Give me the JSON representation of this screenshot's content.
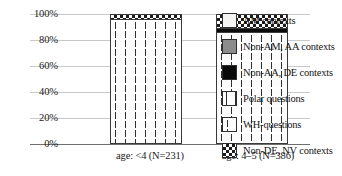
{
  "chart_data": {
    "type": "bar",
    "subtype": "stacked-percentage",
    "title": "",
    "xlabel": "",
    "ylabel": "",
    "ylim": [
      0,
      100
    ],
    "ytick_labels": [
      "100%",
      "80%",
      "60%",
      "40%",
      "20%",
      "0%"
    ],
    "ytick_values": [
      100,
      80,
      60,
      40,
      20,
      0
    ],
    "grid": true,
    "legend_position": "right",
    "categories": [
      "age: <4 (N=231)",
      "age: 4–5 (N=386)"
    ],
    "series": [
      {
        "name": "AM contexts",
        "pattern": "solid-white",
        "color": "#f4f4f2",
        "values": [
          0,
          0
        ]
      },
      {
        "name": "Non-AM, AA contexts",
        "pattern": "solid-gray",
        "color": "#8c8c8c",
        "values": [
          0,
          0
        ]
      },
      {
        "name": "Non-AA, DE contexts",
        "pattern": "solid-black",
        "color": "#0a0a0a",
        "values": [
          0,
          0
        ]
      },
      {
        "name": "Polar questions",
        "pattern": "dashes",
        "color": "#2b2b2b",
        "values": [
          0,
          0
        ]
      },
      {
        "name": "WH-questions",
        "pattern": "vertical-ticks",
        "color": "#2f2f2f",
        "values": [
          97,
          87
        ]
      },
      {
        "name": "Non-DE, NV contexts",
        "pattern": "checkerboard",
        "color": "#1c1c1c",
        "values": [
          3,
          13
        ]
      }
    ],
    "bars": [
      {
        "category": "age: <4 (N=231)",
        "segments": [
          {
            "label": "WH-questions",
            "value": 97
          },
          {
            "label": "Non-DE, NV contexts",
            "value": 3
          }
        ]
      },
      {
        "category": "age: 4–5 (N=386)",
        "segments": [
          {
            "label": "WH-questions",
            "value": 87
          },
          {
            "label": "Non-AA, DE contexts",
            "value": 3
          },
          {
            "label": "Non-DE, NV contexts",
            "value": 10
          }
        ]
      }
    ]
  },
  "legend": {
    "items": [
      {
        "label": "AM contexts",
        "swatch": "solid-white-swatch"
      },
      {
        "label": "Non-AM, AA contexts",
        "swatch": "solid-gray-swatch"
      },
      {
        "label": "Non-AA, DE contexts",
        "swatch": "solid-black-swatch"
      },
      {
        "label": "Polar questions",
        "swatch": "dashes-swatch"
      },
      {
        "label": "WH-questions",
        "swatch": "vertical-ticks-swatch"
      },
      {
        "label": "Non-DE, NV contexts",
        "swatch": "checkerboard-swatch"
      }
    ]
  },
  "axes": {
    "y_ticks": [
      "100%",
      "80%",
      "60%",
      "40%",
      "20%",
      "0%"
    ],
    "x_labels": [
      "age: <4 (N=231)",
      "age: 4–5 (N=386)"
    ]
  }
}
